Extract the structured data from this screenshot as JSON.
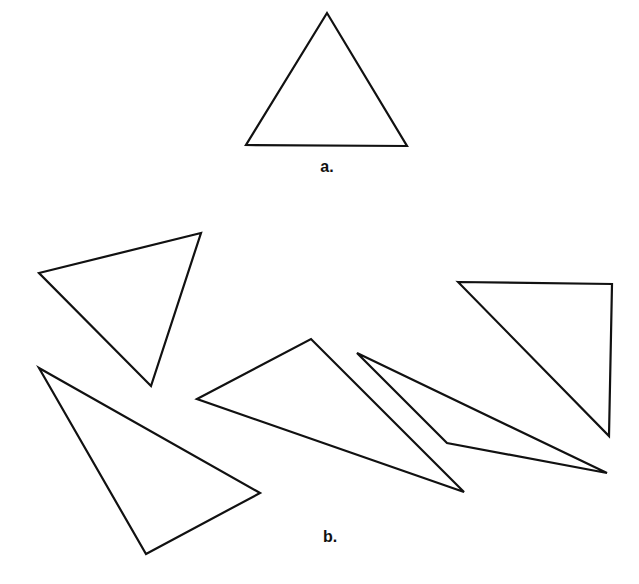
{
  "figure": {
    "stroke_color": "#111111",
    "background": "#ffffff",
    "part_a": {
      "label": "a.",
      "label_pos": [
        327,
        167
      ],
      "triangles": [
        {
          "id": "equilateral",
          "points": [
            [
              327,
              13
            ],
            [
              246,
              145
            ],
            [
              407,
              146
            ]
          ]
        }
      ]
    },
    "part_b": {
      "label": "b.",
      "label_pos": [
        330,
        537
      ],
      "triangles": [
        {
          "id": "b1",
          "points": [
            [
              39,
              273
            ],
            [
              201,
              233
            ],
            [
              151,
              386
            ]
          ]
        },
        {
          "id": "b2",
          "points": [
            [
              39,
              368
            ],
            [
              260,
              493
            ],
            [
              146,
              554
            ]
          ]
        },
        {
          "id": "b3",
          "points": [
            [
              197,
              399
            ],
            [
              311,
              339
            ],
            [
              464,
              492
            ]
          ]
        },
        {
          "id": "b4",
          "points": [
            [
              357,
              353
            ],
            [
              447,
              443
            ],
            [
              607,
              473
            ]
          ]
        },
        {
          "id": "b5",
          "points": [
            [
              458,
              282
            ],
            [
              612,
              284
            ],
            [
              609,
              436
            ]
          ]
        }
      ]
    }
  }
}
